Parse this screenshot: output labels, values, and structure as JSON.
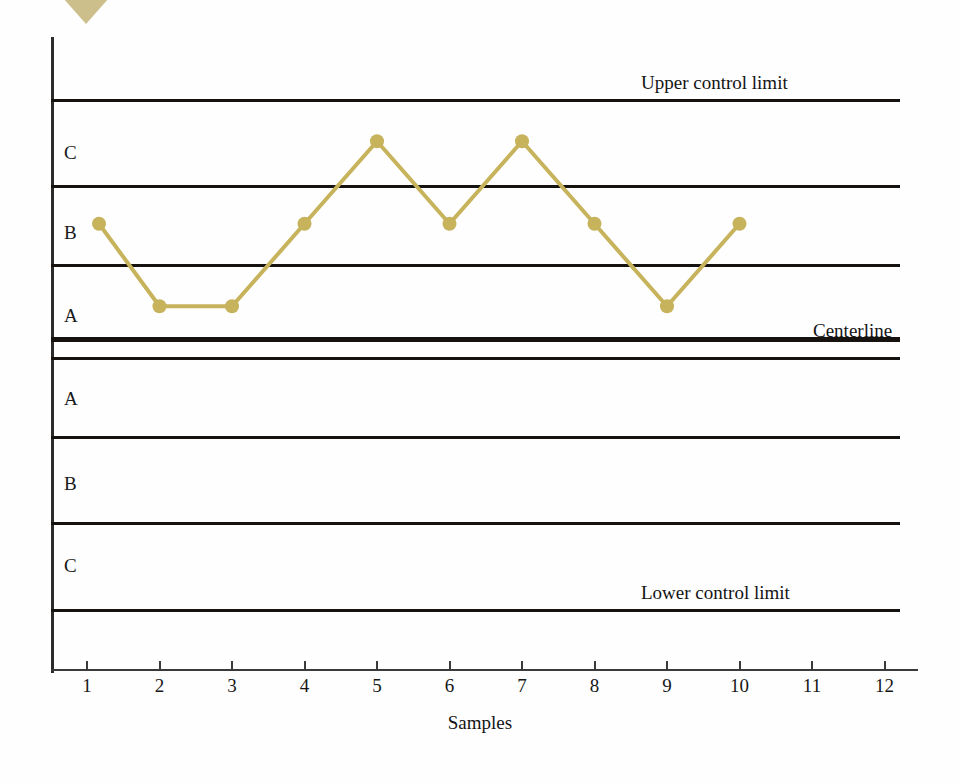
{
  "chart_data": {
    "type": "line",
    "title": "",
    "xlabel": "Samples",
    "ylabel": "",
    "grid": true,
    "legend_position": "none",
    "x": [
      1,
      2,
      3,
      4,
      5,
      6,
      7,
      8,
      9,
      10
    ],
    "xticks": [
      "1",
      "2",
      "3",
      "4",
      "5",
      "6",
      "7",
      "8",
      "9",
      "10",
      "11",
      "12"
    ],
    "xlim": [
      0.5,
      12.5
    ],
    "series": [
      {
        "name": "sample means",
        "values": [
          1.5,
          0.5,
          0.5,
          1.5,
          2.5,
          1.5,
          2.5,
          1.5,
          0.5,
          1.5
        ],
        "zone_positions": [
          "B",
          "A",
          "A",
          "B",
          "C",
          "B",
          "C",
          "B",
          "A",
          "B"
        ],
        "color": "#c6b35c",
        "marker": "circle"
      }
    ],
    "zone_lines": [
      {
        "id": "upper-control-limit",
        "label": "Upper control limit",
        "value": 3,
        "weight": "thin"
      },
      {
        "id": "upper-c-b",
        "label": "",
        "value": 2,
        "weight": "thin"
      },
      {
        "id": "upper-b-a",
        "label": "",
        "value": 1,
        "weight": "thin"
      },
      {
        "id": "centerline",
        "label": "Centerline",
        "value": 0,
        "weight": "thick"
      },
      {
        "id": "lower-a-b",
        "label": "",
        "value": -1,
        "weight": "thin"
      },
      {
        "id": "lower-b-c",
        "label": "",
        "value": -2,
        "weight": "thin"
      },
      {
        "id": "lower-control-limit",
        "label": "Lower control limit",
        "value": -3,
        "weight": "thin"
      }
    ],
    "zone_labels_upper": [
      "C",
      "B",
      "A"
    ],
    "zone_labels_lower": [
      "A",
      "B",
      "C"
    ],
    "ylim": [
      -3.6,
      3.6
    ]
  },
  "chart": {
    "zones": [
      {
        "letter": "C",
        "position": "upper"
      },
      {
        "letter": "B",
        "position": "upper"
      },
      {
        "letter": "A",
        "position": "upper"
      },
      {
        "letter": "A",
        "position": "lower"
      },
      {
        "letter": "B",
        "position": "lower"
      },
      {
        "letter": "C",
        "position": "lower"
      }
    ],
    "captions": {
      "upper_control_limit": "Upper control limit",
      "centerline": "Centerline",
      "lower_control_limit": "Lower control limit"
    },
    "axis": {
      "x_title": "Samples",
      "ticks": [
        "1",
        "2",
        "3",
        "4",
        "5",
        "6",
        "7",
        "8",
        "9",
        "10",
        "11",
        "12"
      ]
    },
    "colors": {
      "series": "#c6b35c",
      "line": "#15120f",
      "axis": "#3a3a3a",
      "text": "#171717",
      "wedge": "#c9bc86"
    }
  }
}
